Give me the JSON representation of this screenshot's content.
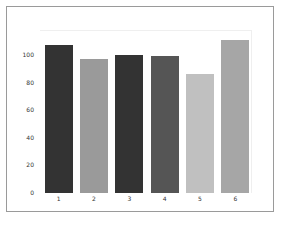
{
  "chart_data": {
    "type": "bar",
    "title": "",
    "xlabel": "",
    "ylabel": "",
    "categories": [
      "1",
      "2",
      "3",
      "4",
      "5",
      "6"
    ],
    "values": [
      107,
      97,
      100,
      99,
      86,
      111
    ],
    "colors": [
      "#333333",
      "#9a9a9a",
      "#333333",
      "#555555",
      "#c0c0c0",
      "#a6a6a6"
    ],
    "ylim": [
      0,
      118
    ],
    "yticks": [
      "0",
      "20",
      "40",
      "60",
      "80",
      "100"
    ],
    "grid": false,
    "legend": null
  }
}
